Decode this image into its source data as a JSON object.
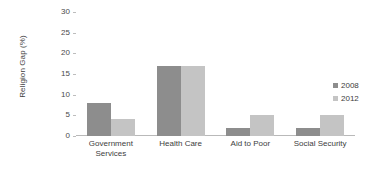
{
  "chart_data": {
    "type": "bar",
    "title": "",
    "subtitle": "",
    "xlabel": "",
    "ylabel": "Religion Gap (%)",
    "ylim": [
      0,
      30
    ],
    "yticks": [
      0,
      5,
      10,
      15,
      20,
      25,
      30
    ],
    "ytick_labels": [
      "0",
      "5",
      "10",
      "15",
      "20",
      "25",
      "30"
    ],
    "grid": false,
    "legend_position": "right",
    "categories": [
      "Government Services",
      "Health Care",
      "Aid to Poor",
      "Social Security"
    ],
    "category_label_lines": [
      [
        "Government",
        "Services"
      ],
      [
        "Health Care"
      ],
      [
        "Aid to Poor"
      ],
      [
        "Social Security"
      ]
    ],
    "series": [
      {
        "name": "2008",
        "color": "#8d8d8d",
        "values": [
          8,
          17,
          2,
          2
        ]
      },
      {
        "name": "2012",
        "color": "#c4c4c4",
        "values": [
          4,
          17,
          5,
          5
        ]
      }
    ]
  },
  "legend": {
    "items": [
      {
        "label": "2008",
        "color": "#8d8d8d"
      },
      {
        "label": "2012",
        "color": "#c4c4c4"
      }
    ]
  },
  "axis": {
    "baseline_color": "#b9b9b9",
    "tick_color": "#bdbdbd"
  }
}
